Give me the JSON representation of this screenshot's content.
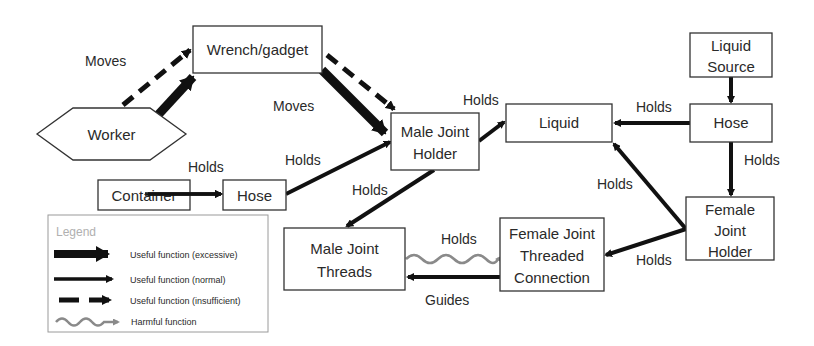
{
  "diagram": {
    "nodes": {
      "wrench": {
        "label": "Wrench/gadget"
      },
      "worker": {
        "label": "Worker"
      },
      "male_joint_holder": {
        "line1": "Male Joint",
        "line2": "Holder"
      },
      "liquid": {
        "label": "Liquid"
      },
      "liquid_source": {
        "line1": "Liquid",
        "line2": "Source"
      },
      "hose_right": {
        "label": "Hose"
      },
      "female_joint_holder": {
        "line1": "Female",
        "line2": "Joint",
        "line3": "Holder"
      },
      "female_threaded": {
        "line1": "Female  Joint",
        "line2": "Threaded",
        "line3": "Connection"
      },
      "male_threads": {
        "line1": "Male Joint",
        "line2": "Threads"
      },
      "container": {
        "label": "Container"
      },
      "hose_left": {
        "label": "Hose"
      }
    },
    "edges": [
      {
        "from": "Worker",
        "to": "Wrench/gadget",
        "label": "Moves",
        "type": "excessive"
      },
      {
        "from": "Worker",
        "to": "Wrench/gadget",
        "label": "Moves",
        "type": "insufficient"
      },
      {
        "from": "Wrench/gadget",
        "to": "Male Joint Holder",
        "label": "Moves",
        "type": "excessive"
      },
      {
        "from": "Wrench/gadget",
        "to": "Male Joint Holder",
        "label": "Moves",
        "type": "insufficient"
      },
      {
        "from": "Male Joint Holder",
        "to": "Liquid",
        "label": "Holds",
        "type": "normal"
      },
      {
        "from": "Hose",
        "to": "Liquid",
        "label": "Holds",
        "type": "normal"
      },
      {
        "from": "Liquid Source",
        "to": "Hose",
        "label": "",
        "type": "normal"
      },
      {
        "from": "Hose",
        "to": "Female Joint Holder",
        "label": "Holds",
        "type": "normal"
      },
      {
        "from": "Female Joint Holder",
        "to": "Liquid",
        "label": "Holds",
        "type": "normal"
      },
      {
        "from": "Female Joint Holder",
        "to": "Female Joint Threaded Connection",
        "label": "Holds",
        "type": "normal"
      },
      {
        "from": "Female Joint Threaded Connection",
        "to": "Male Joint Threads",
        "label": "Guides",
        "type": "normal"
      },
      {
        "from": "Male Joint Threads",
        "to": "Female Joint Threaded Connection",
        "label": "Holds",
        "type": "harmful"
      },
      {
        "from": "Male Joint Holder",
        "to": "Male Joint Threads",
        "label": "Holds",
        "type": "normal"
      },
      {
        "from": "Hose",
        "to": "Male Joint Holder",
        "label": "Holds",
        "type": "normal"
      },
      {
        "from": "Container",
        "to": "Hose",
        "label": "Holds",
        "type": "normal"
      }
    ],
    "edge_labels": {
      "moves_worker": "Moves",
      "moves_wrench": "Moves",
      "holds_mjh_liquid": "Holds",
      "holds_hose_liquid": "Holds",
      "holds_hose_fjh": "Holds",
      "holds_fjh_liquid": "Holds",
      "holds_fjh_ftc": "Holds",
      "guides": "Guides",
      "holds_harmful": "Holds",
      "holds_mjh_mjt": "Holds",
      "holds_hose_mjh": "Holds",
      "holds_container_hose": "Holds"
    },
    "legend": {
      "title": "Legend",
      "items": [
        {
          "label": "Useful function (excessive)",
          "type": "excessive"
        },
        {
          "label": "Useful function (normal)",
          "type": "normal"
        },
        {
          "label": "Useful function (insufficient)",
          "type": "insufficient"
        },
        {
          "label": "Harmful function",
          "type": "harmful"
        }
      ]
    },
    "colors": {
      "arrow": "#111111",
      "harmful": "#8a8a8a",
      "box_stroke": "#333333",
      "legend_title": "#b0b0b0"
    }
  }
}
